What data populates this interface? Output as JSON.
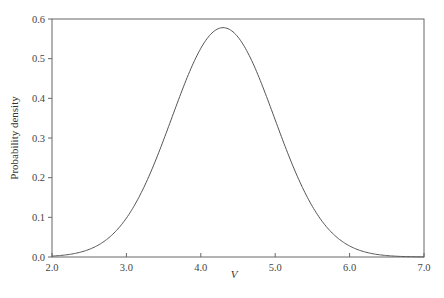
{
  "chart_data": {
    "type": "line",
    "title": "",
    "xlabel": "V",
    "ylabel": "Probability density",
    "xlim": [
      2.0,
      7.0
    ],
    "ylim": [
      0.0,
      0.6
    ],
    "x_ticks": [
      "2.0",
      "3.0",
      "4.0",
      "5.0",
      "6.0",
      "7.0"
    ],
    "y_ticks": [
      "0.0",
      "0.1",
      "0.2",
      "0.3",
      "0.4",
      "0.5",
      "0.6"
    ],
    "grid": false,
    "legend": null,
    "series": [
      {
        "name": "density",
        "color": "#555555",
        "x": [
          2.0,
          2.25,
          2.5,
          2.75,
          3.0,
          3.25,
          3.5,
          3.75,
          4.0,
          4.15,
          4.3,
          4.45,
          4.6,
          4.75,
          5.0,
          5.25,
          5.5,
          5.75,
          6.0,
          6.25,
          6.5,
          6.75,
          7.0
        ],
        "y": [
          0.0018,
          0.0068,
          0.0192,
          0.0467,
          0.097,
          0.1739,
          0.2956,
          0.4208,
          0.5246,
          0.5664,
          0.5782,
          0.5664,
          0.5246,
          0.4592,
          0.3471,
          0.2265,
          0.1275,
          0.0609,
          0.0242,
          0.0081,
          0.0022,
          0.0005,
          0.0001
        ]
      }
    ]
  }
}
